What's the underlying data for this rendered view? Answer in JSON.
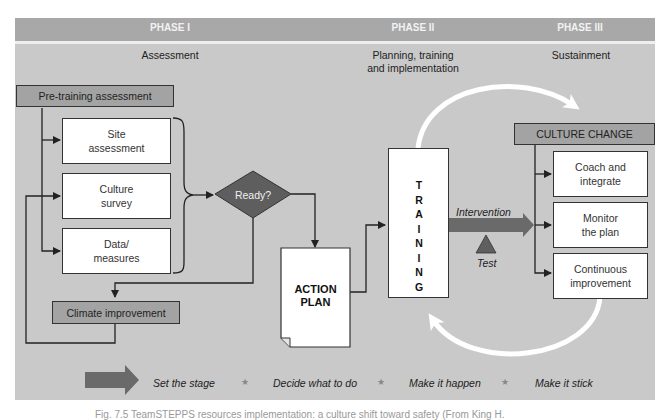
{
  "phases": [
    {
      "title": "PHASE I",
      "subtitle": "Assessment"
    },
    {
      "title": "PHASE II",
      "subtitle_line1": "Planning, training",
      "subtitle_line2": "and implementation"
    },
    {
      "title": "PHASE III",
      "subtitle": "Sustainment"
    }
  ],
  "phase1": {
    "pre_training": "Pre-training assessment",
    "boxes": [
      {
        "line1": "Site",
        "line2": "assessment"
      },
      {
        "line1": "Culture",
        "line2": "survey"
      },
      {
        "line1": "Data/",
        "line2": "measures"
      }
    ],
    "decision": "Ready?",
    "climate": "Climate improvement"
  },
  "phase2": {
    "action_plan_line1": "ACTION",
    "action_plan_line2": "PLAN",
    "training_letters": [
      "T",
      "R",
      "A",
      "I",
      "N",
      "I",
      "N",
      "G"
    ],
    "intervention": "Intervention",
    "test": "Test"
  },
  "phase3": {
    "culture_change": "CULTURE CHANGE",
    "boxes": [
      {
        "line1": "Coach and",
        "line2": "integrate"
      },
      {
        "line1": "Monitor",
        "line2": "the plan"
      },
      {
        "line1": "Continuous",
        "line2": "improvement"
      }
    ]
  },
  "legend": {
    "items": [
      "Set the stage",
      "Decide what to do",
      "Make it happen",
      "Make it stick"
    ],
    "separator": "★"
  },
  "caption": "Fig. 7.5 TeamSTEPPS resources implementation: a culture shift toward safety (From King H."
}
